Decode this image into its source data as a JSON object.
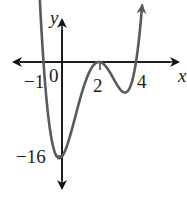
{
  "chart_data": {
    "type": "line",
    "title": "",
    "xlabel": "x",
    "ylabel": "y",
    "function": "f(x) = (x+1)(x-2)^2(x-4)",
    "x_ticks": [
      {
        "value": -1,
        "label": "−1"
      },
      {
        "value": 0,
        "label": "0"
      },
      {
        "value": 2,
        "label": "2"
      },
      {
        "value": 4,
        "label": "4"
      }
    ],
    "y_ticks": [
      {
        "value": -16,
        "label": "−16"
      }
    ],
    "key_points": [
      {
        "x": -1,
        "y": 0,
        "note": "x-intercept"
      },
      {
        "x": 0,
        "y": -16,
        "note": "y-intercept"
      },
      {
        "x": 2,
        "y": 0,
        "note": "double root / local max"
      },
      {
        "x": 4,
        "y": 0,
        "note": "x-intercept"
      }
    ],
    "series": [
      {
        "name": "f(x)",
        "x": [
          -1.2,
          -1,
          -0.5,
          0,
          0.3,
          0.5,
          1,
          1.5,
          2,
          2.5,
          3,
          3.2,
          3.5,
          4,
          4.2
        ],
        "y": [
          3.5,
          0,
          -10.7,
          -16,
          -17.1,
          -16.9,
          -12,
          -4.4,
          0,
          -3.4,
          -4,
          -3.8,
          -3.4,
          0,
          1.6
        ]
      }
    ],
    "xlim": [
      -2.6,
      6.5
    ],
    "ylim": [
      -21,
      7
    ],
    "grid": false,
    "legend": "none",
    "colors": {
      "curve": "#5a5a5a",
      "axes": "#111111"
    }
  },
  "labels": {
    "x_axis": "x",
    "y_axis": "y",
    "tick_neg1": "−1",
    "tick_0": "0",
    "tick_2": "2",
    "tick_4": "4",
    "tick_neg16": "−16"
  }
}
